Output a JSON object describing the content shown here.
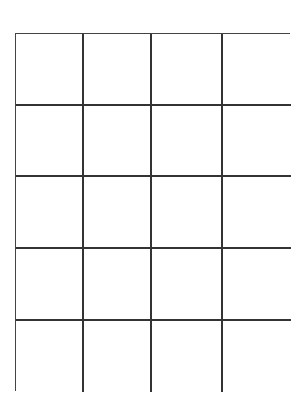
{
  "grid": {
    "columns": 4,
    "rows": 5,
    "line_color": "#333333",
    "background": "#ffffff",
    "cells": [
      [
        "",
        "",
        "",
        ""
      ],
      [
        "",
        "",
        "",
        ""
      ],
      [
        "",
        "",
        "",
        ""
      ],
      [
        "",
        "",
        "",
        ""
      ],
      [
        "",
        "",
        "",
        ""
      ]
    ]
  }
}
